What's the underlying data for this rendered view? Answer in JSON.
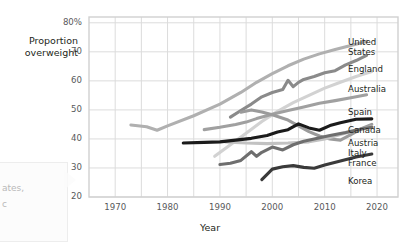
{
  "chart_data": {
    "type": "line",
    "title": "",
    "xlabel": "Year",
    "ylabel": "Proportion\noverweight",
    "xlim": [
      1965,
      2024
    ],
    "ylim": [
      20,
      82
    ],
    "xticks": [
      1970,
      1980,
      1990,
      2000,
      2010,
      2020
    ],
    "yticks": [
      "20",
      "30",
      "40",
      "50",
      "60",
      "70",
      "80%"
    ],
    "ytick_values": [
      20,
      30,
      40,
      50,
      60,
      70,
      80
    ],
    "grid": true,
    "legend_position": "right-inline",
    "series": [
      {
        "name": "United States",
        "color": "#b0b0b0",
        "points": [
          [
            1973,
            44.8
          ],
          [
            1976,
            44.2
          ],
          [
            1978,
            43.0
          ],
          [
            1980,
            44.5
          ],
          [
            1985,
            48.0
          ],
          [
            1990,
            52.0
          ],
          [
            1994,
            56.0
          ],
          [
            1997,
            59.5
          ],
          [
            2000,
            62.5
          ],
          [
            2003,
            65.2
          ],
          [
            2006,
            67.5
          ],
          [
            2009,
            69.3
          ],
          [
            2012,
            70.8
          ],
          [
            2015,
            72.2
          ],
          [
            2018,
            73.6
          ]
        ]
      },
      {
        "name": "England",
        "color": "#8a8a8a",
        "points": [
          [
            1992,
            47.5
          ],
          [
            1994,
            49.8
          ],
          [
            1996,
            52.0
          ],
          [
            1998,
            54.5
          ],
          [
            2000,
            56.0
          ],
          [
            2002,
            57.0
          ],
          [
            2003,
            60.2
          ],
          [
            2004,
            58.0
          ],
          [
            2005,
            59.5
          ],
          [
            2006,
            60.5
          ],
          [
            2008,
            61.5
          ],
          [
            2010,
            62.8
          ],
          [
            2012,
            63.5
          ],
          [
            2014,
            65.5
          ],
          [
            2016,
            67.0
          ],
          [
            2018,
            68.8
          ]
        ]
      },
      {
        "name": "Australia",
        "color": "#d2d2d2",
        "points": [
          [
            1989,
            34.0
          ],
          [
            1992,
            38.0
          ],
          [
            1995,
            42.0
          ],
          [
            1998,
            46.0
          ],
          [
            2001,
            49.5
          ],
          [
            2004,
            52.5
          ],
          [
            2007,
            55.0
          ],
          [
            2010,
            57.5
          ],
          [
            2013,
            59.5
          ],
          [
            2016,
            61.5
          ],
          [
            2019,
            63.2
          ]
        ]
      },
      {
        "name": "Spain",
        "color": "#a0a0a0",
        "points": [
          [
            1987,
            43.2
          ],
          [
            1990,
            44.0
          ],
          [
            1993,
            45.0
          ],
          [
            1995,
            45.8
          ],
          [
            1997,
            47.0
          ],
          [
            2000,
            48.5
          ],
          [
            2003,
            49.8
          ],
          [
            2006,
            51.0
          ],
          [
            2009,
            52.3
          ],
          [
            2012,
            53.2
          ],
          [
            2015,
            54.2
          ],
          [
            2018,
            55.2
          ]
        ]
      },
      {
        "name": "Canada",
        "color": "#9b9b9b",
        "points": [
          [
            1994,
            49.2
          ],
          [
            1996,
            50.0
          ],
          [
            1998,
            49.3
          ],
          [
            2000,
            48.3
          ],
          [
            2003,
            46.5
          ],
          [
            2005,
            44.5
          ],
          [
            2007,
            42.5
          ],
          [
            2009,
            41.0
          ],
          [
            2011,
            40.0
          ],
          [
            2013,
            39.6
          ],
          [
            2015,
            41.5
          ],
          [
            2017,
            43.5
          ],
          [
            2019,
            45.0
          ]
        ]
      },
      {
        "name": "Austria",
        "color": "#c2c2c2",
        "points": [
          [
            1991,
            39.0
          ],
          [
            1995,
            38.6
          ],
          [
            1999,
            38.4
          ],
          [
            2003,
            38.6
          ],
          [
            2007,
            39.0
          ],
          [
            2010,
            40.0
          ],
          [
            2013,
            41.5
          ],
          [
            2016,
            43.0
          ],
          [
            2019,
            44.2
          ]
        ]
      },
      {
        "name": "Italy",
        "color": "#1b1b1b",
        "points": [
          [
            1983,
            38.6
          ],
          [
            1987,
            38.8
          ],
          [
            1990,
            39.0
          ],
          [
            1993,
            39.6
          ],
          [
            1996,
            40.2
          ],
          [
            1999,
            41.2
          ],
          [
            2001,
            42.4
          ],
          [
            2003,
            43.2
          ],
          [
            2005,
            45.2
          ],
          [
            2007,
            43.8
          ],
          [
            2009,
            43.0
          ],
          [
            2011,
            44.6
          ],
          [
            2013,
            45.6
          ],
          [
            2016,
            46.8
          ],
          [
            2019,
            46.9
          ]
        ]
      },
      {
        "name": "France",
        "color": "#6e6e6e",
        "points": [
          [
            1990,
            31.2
          ],
          [
            1992,
            31.6
          ],
          [
            1994,
            32.6
          ],
          [
            1996,
            35.6
          ],
          [
            1997,
            34.0
          ],
          [
            1998,
            35.4
          ],
          [
            2000,
            37.2
          ],
          [
            2002,
            36.2
          ],
          [
            2004,
            38.0
          ],
          [
            2006,
            39.2
          ],
          [
            2008,
            40.0
          ],
          [
            2011,
            41.2
          ],
          [
            2014,
            42.2
          ],
          [
            2017,
            43.4
          ],
          [
            2019,
            44.0
          ]
        ]
      },
      {
        "name": "Korea",
        "color": "#3a3a3a",
        "points": [
          [
            1998,
            26.0
          ],
          [
            2000,
            29.6
          ],
          [
            2002,
            30.4
          ],
          [
            2004,
            30.8
          ],
          [
            2006,
            30.2
          ],
          [
            2008,
            29.9
          ],
          [
            2010,
            31.0
          ],
          [
            2013,
            32.4
          ],
          [
            2016,
            33.8
          ],
          [
            2019,
            34.8
          ]
        ]
      }
    ],
    "legend_entries": [
      {
        "label": "United\nStates",
        "y": 38
      },
      {
        "label": "England",
        "y": 65
      },
      {
        "label": "Australia",
        "y": 85
      },
      {
        "label": "Spain",
        "y": 108
      },
      {
        "label": "Canada",
        "y": 126
      },
      {
        "label": "Austria",
        "y": 139
      },
      {
        "label": "Italy",
        "y": 149
      },
      {
        "label": "France",
        "y": 159
      },
      {
        "label": "Korea",
        "y": 177
      }
    ]
  },
  "callout": {
    "line1": "ates,",
    "line2": "c"
  },
  "colors": {
    "grid": "#dcdcdc",
    "frame": "#d0d0d0",
    "tick_text": "#58595b",
    "label_text": "#231f20"
  }
}
